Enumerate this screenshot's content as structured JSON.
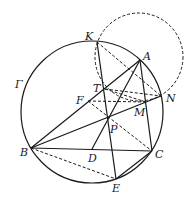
{
  "diagram": {
    "type": "geometry",
    "circles": [
      {
        "name": "Gamma",
        "label": "Γ",
        "cx": 92,
        "cy": 112,
        "r": 71,
        "style": "solid"
      },
      {
        "name": "circle-KTN",
        "cx": 139,
        "cy": 57,
        "r": 44,
        "style": "dashed"
      }
    ],
    "points": {
      "K": {
        "label": "K",
        "x": 97,
        "y": 42,
        "lx": 85,
        "ly": 40
      },
      "A": {
        "label": "A",
        "x": 140,
        "y": 60,
        "lx": 143,
        "ly": 60
      },
      "T": {
        "label": "T",
        "x": 105,
        "y": 89,
        "lx": 93,
        "ly": 92
      },
      "F": {
        "label": "F",
        "x": 88,
        "y": 101,
        "lx": 76,
        "ly": 104
      },
      "N": {
        "label": "N",
        "x": 161,
        "y": 96,
        "lx": 166,
        "ly": 102
      },
      "M": {
        "label": "M",
        "x": 146,
        "y": 102,
        "lx": 134,
        "ly": 116
      },
      "P": {
        "label": "P",
        "x": 108,
        "y": 118,
        "lx": 110,
        "ly": 133
      },
      "B": {
        "label": "B",
        "x": 31,
        "y": 148,
        "lx": 20,
        "ly": 156
      },
      "D": {
        "label": "D",
        "x": 92,
        "y": 149,
        "lx": 88,
        "ly": 162
      },
      "C": {
        "label": "C",
        "x": 152,
        "y": 151,
        "lx": 155,
        "ly": 158
      },
      "E": {
        "label": "E",
        "x": 116,
        "y": 179,
        "lx": 112,
        "ly": 192
      }
    },
    "gamma_label": {
      "text": "Γ",
      "x": 15,
      "y": 88
    },
    "solid_segments": [
      [
        "B",
        "A"
      ],
      [
        "B",
        "N"
      ],
      [
        "B",
        "C"
      ],
      [
        "K",
        "E"
      ],
      [
        "A",
        "D"
      ],
      [
        "A",
        "C"
      ],
      [
        "C",
        "E"
      ]
    ],
    "dashed_segments": [
      [
        "K",
        "N"
      ],
      [
        "T",
        "N"
      ],
      [
        "F",
        "M"
      ],
      [
        "F",
        "C"
      ],
      [
        "B",
        "E"
      ],
      [
        "T",
        "M"
      ]
    ]
  }
}
